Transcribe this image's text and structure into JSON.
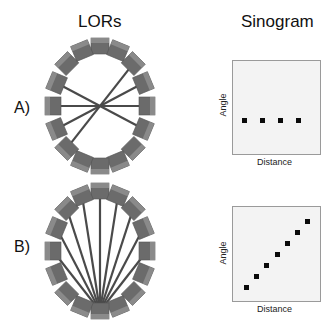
{
  "headers": {
    "lors": "LORs",
    "sinogram": "Sinogram"
  },
  "rows": [
    {
      "label": "A)",
      "lor_pattern": "parallel",
      "x_label": "Distance",
      "y_label": "Angle"
    },
    {
      "label": "B)",
      "lor_pattern": "fan",
      "x_label": "Distance",
      "y_label": "Angle"
    }
  ],
  "colors": {
    "cube": "#6b6b6b",
    "cube_light": "#8a8a8a",
    "line": "#4a4a4a",
    "dot": "#0a0a0a",
    "box_bg": "#f3f3f3"
  },
  "detectors_per_ring": 16,
  "sinogram_points": {
    "A": [
      [
        244,
        120
      ],
      [
        262,
        120
      ],
      [
        280,
        120
      ],
      [
        298,
        120
      ]
    ],
    "B": [
      [
        246,
        287
      ],
      [
        256,
        276
      ],
      [
        266,
        265
      ],
      [
        277,
        254
      ],
      [
        287,
        243
      ],
      [
        297,
        232
      ],
      [
        307,
        221
      ]
    ]
  }
}
